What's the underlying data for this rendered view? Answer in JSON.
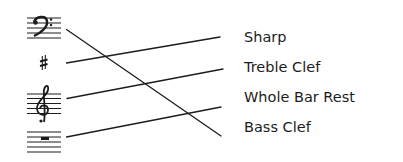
{
  "symbols": [
    {
      "name": "bass-clef",
      "glyph": "𝄢"
    },
    {
      "name": "sharp",
      "glyph": "♯"
    },
    {
      "name": "treble-clef",
      "glyph": "𝄞"
    },
    {
      "name": "whole-bar-rest",
      "glyph": "rest"
    }
  ],
  "labels": [
    {
      "text": "Sharp"
    },
    {
      "text": "Treble Clef"
    },
    {
      "text": "Whole Bar Rest"
    },
    {
      "text": "Bass Clef"
    }
  ],
  "connections": [
    {
      "from": "bass-clef",
      "to": "Bass Clef"
    },
    {
      "from": "sharp",
      "to": "Sharp"
    },
    {
      "from": "treble-clef",
      "to": "Treble Clef"
    },
    {
      "from": "whole-bar-rest",
      "to": "Whole Bar Rest"
    }
  ],
  "colors": {
    "ink": "#1c1c1c",
    "background": "#ffffff"
  }
}
